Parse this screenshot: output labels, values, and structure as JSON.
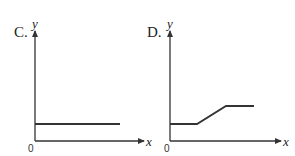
{
  "graphs": [
    {
      "option_label": "C.",
      "y_axis_label": "y",
      "x_axis_label": "x",
      "origin_label": "0",
      "description": "constant horizontal line",
      "points": [
        [
          35,
          124
        ],
        [
          120,
          124
        ]
      ]
    },
    {
      "option_label": "D.",
      "y_axis_label": "y",
      "x_axis_label": "x",
      "origin_label": "0",
      "description": "constant, then linear increase, then constant",
      "points": [
        [
          170,
          124
        ],
        [
          197,
          124
        ],
        [
          226,
          106
        ],
        [
          254,
          106
        ]
      ]
    }
  ],
  "colors": {
    "line": "#333333",
    "axis": "#333333",
    "background": "#ffffff"
  }
}
